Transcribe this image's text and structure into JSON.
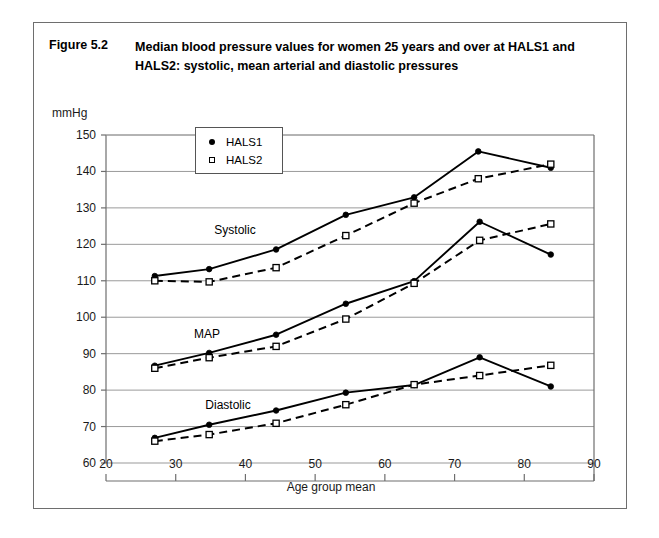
{
  "figure": {
    "number": "Figure 5.2",
    "title": "Median blood pressure values for women 25 years and over at HALS1 and HALS2: systolic, mean arterial and diastolic pressures"
  },
  "legend": {
    "items": [
      {
        "label": "HALS1",
        "marker": "filled-circle"
      },
      {
        "label": "HALS2",
        "marker": "open-square"
      }
    ]
  },
  "colors": {
    "line": "#000000",
    "grid": "#9a9a9a",
    "axis": "#6e6e6e",
    "frame": "#6e6e6e",
    "background": "#ffffff"
  },
  "chart_data": {
    "type": "line",
    "title": "Median blood pressure values for women 25 years and over at HALS1 and HALS2: systolic, mean arterial and diastolic pressures",
    "xlabel": "Age group mean",
    "ylabel": "mmHg",
    "xlim": [
      20,
      90
    ],
    "ylim": [
      60,
      150
    ],
    "xticks": [
      20,
      30,
      40,
      50,
      60,
      70,
      80,
      90
    ],
    "yticks": [
      60,
      70,
      80,
      90,
      100,
      110,
      120,
      130,
      140,
      150
    ],
    "grid": "horizontal",
    "legend_position": "upper-left-inside",
    "annotations": [
      {
        "text": "Systolic",
        "x": 38.5,
        "y": 124
      },
      {
        "text": "MAP",
        "x": 34.5,
        "y": 95.5
      },
      {
        "text": "Diastolic",
        "x": 37.5,
        "y": 76
      }
    ],
    "groups": [
      {
        "name": "Systolic",
        "series": [
          {
            "name": "HALS1",
            "marker": "filled-circle",
            "linestyle": "solid",
            "x": [
              27,
              34.8,
              44.4,
              54.4,
              64.2,
              73.4,
              83.8
            ],
            "values": [
              111.3,
              113.2,
              118.6,
              128.1,
              132.9,
              145.5,
              141.0
            ]
          },
          {
            "name": "HALS2",
            "marker": "open-square",
            "linestyle": "dashed",
            "x": [
              27,
              34.8,
              44.4,
              54.4,
              64.2,
              73.4,
              83.8
            ],
            "values": [
              110.0,
              109.7,
              113.6,
              122.4,
              131.3,
              138.0,
              142.0
            ]
          }
        ]
      },
      {
        "name": "MAP",
        "series": [
          {
            "name": "HALS1",
            "marker": "filled-circle",
            "linestyle": "solid",
            "x": [
              27,
              34.8,
              44.4,
              54.4,
              64.2,
              73.6,
              83.8
            ],
            "values": [
              86.7,
              90.2,
              95.2,
              103.7,
              109.9,
              126.2,
              117.2
            ]
          },
          {
            "name": "HALS2",
            "marker": "open-square",
            "linestyle": "dashed",
            "x": [
              27,
              34.8,
              44.4,
              54.4,
              64.2,
              73.6,
              83.8
            ],
            "values": [
              86.0,
              88.9,
              92.0,
              99.5,
              109.3,
              121.1,
              125.6
            ]
          }
        ]
      },
      {
        "name": "Diastolic",
        "series": [
          {
            "name": "HALS1",
            "marker": "filled-circle",
            "linestyle": "solid",
            "x": [
              27,
              34.8,
              44.4,
              54.4,
              64.2,
              73.6,
              83.8
            ],
            "values": [
              66.9,
              70.5,
              74.4,
              79.3,
              81.4,
              89.0,
              81.0
            ]
          },
          {
            "name": "HALS2",
            "marker": "open-square",
            "linestyle": "dashed",
            "x": [
              27,
              34.8,
              44.4,
              54.4,
              64.2,
              73.6,
              83.8
            ],
            "values": [
              66.0,
              67.8,
              70.9,
              76.0,
              81.5,
              84.0,
              86.8
            ]
          }
        ]
      }
    ]
  }
}
